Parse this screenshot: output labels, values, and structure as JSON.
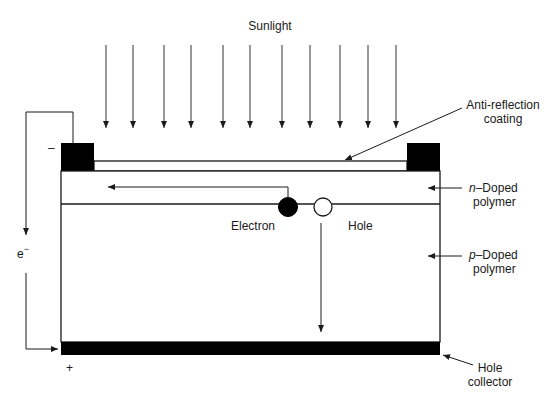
{
  "diagram": {
    "sunlight_label": "Sunlight",
    "sunlight_arrow_count": 11,
    "labels": {
      "anti_reflection_line1": "Anti-reflection",
      "anti_reflection_line2": "coating",
      "n_doped_prefix": "n",
      "n_doped_suffix": "–Doped",
      "n_doped_line2": "polymer",
      "p_doped_prefix": "p",
      "p_doped_suffix": "–Doped",
      "p_doped_line2": "polymer",
      "hole_collector_line1": "Hole",
      "hole_collector_line2": "collector",
      "electron": "Electron",
      "hole": "Hole",
      "electron_flow": "e",
      "electron_flow_sup": "−",
      "negative_terminal": "–",
      "positive_terminal": "+"
    },
    "colors": {
      "line": "#1a1a1a",
      "contact_fill": "#000000",
      "background": "#ffffff",
      "arrow": "#333333"
    }
  }
}
